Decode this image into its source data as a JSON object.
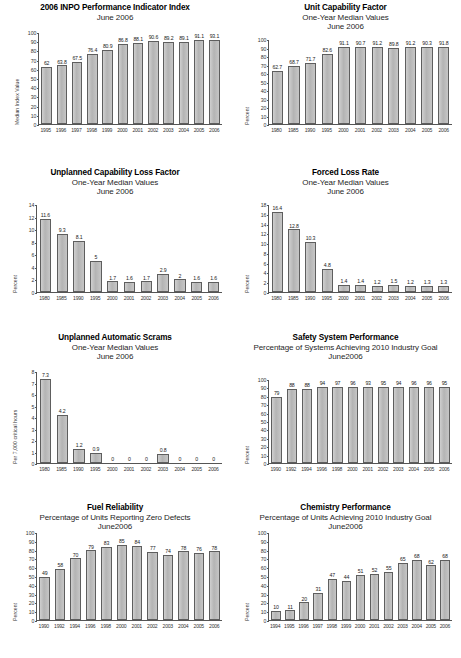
{
  "chart_data": [
    {
      "type": "bar",
      "title": "2006 INPO Performance Indicator Index",
      "subtitle": "June  2006",
      "subtitle2": "",
      "ylabel": "Median Index Value",
      "xlabel": "",
      "ylim": [
        0,
        100
      ],
      "yticks": [
        0,
        10,
        20,
        30,
        40,
        50,
        60,
        70,
        80,
        90,
        100
      ],
      "categories": [
        "1995",
        "1996",
        "1997",
        "1998",
        "1999",
        "2000",
        "2001",
        "2002",
        "2003",
        "2004",
        "2005",
        "2006"
      ],
      "values": [
        62,
        63.8,
        67.5,
        76.4,
        80.9,
        86.8,
        88.1,
        90.6,
        89.2,
        89.1,
        91.1,
        93.1
      ],
      "labels": [
        "62",
        "63.8",
        "67.5",
        "76.4",
        "80.9",
        "86.8",
        "88.1",
        "90.6",
        "89.2",
        "89.1",
        "91.1",
        "93.1"
      ],
      "grid": false,
      "legend": "none"
    },
    {
      "type": "bar",
      "title": "Unit Capability Factor",
      "subtitle": "One-Year Median Values",
      "subtitle2": "June 2006",
      "ylabel": "Percent",
      "xlabel": "",
      "ylim": [
        0,
        100
      ],
      "yticks": [
        0,
        10,
        20,
        30,
        40,
        50,
        60,
        70,
        80,
        90,
        100
      ],
      "categories": [
        "1980",
        "1985",
        "1990",
        "1995",
        "2000",
        "2001",
        "2002",
        "2003",
        "2004",
        "2005",
        "2006"
      ],
      "values": [
        62.7,
        68.7,
        71.7,
        82.6,
        91.1,
        90.7,
        91.2,
        89.8,
        91.2,
        90.3,
        91.8
      ],
      "labels": [
        "62.7",
        "68.7",
        "71.7",
        "82.6",
        "91.1",
        "90.7",
        "91.2",
        "89.8",
        "91.2",
        "90.3",
        "91.8"
      ],
      "grid": false,
      "legend": "none"
    },
    {
      "type": "bar",
      "title": "Unplanned Capability Loss Factor",
      "subtitle": "One-Year Median Values",
      "subtitle2": "June 2006",
      "ylabel": "Percent",
      "xlabel": "",
      "ylim": [
        0,
        14
      ],
      "yticks": [
        0,
        2,
        4,
        6,
        8,
        10,
        12,
        14
      ],
      "categories": [
        "1980",
        "1985",
        "1990",
        "1995",
        "2000",
        "2001",
        "2002",
        "2003",
        "2004",
        "2005",
        "2006"
      ],
      "values": [
        11.6,
        9.3,
        8.1,
        5,
        1.7,
        1.6,
        1.7,
        2.9,
        2,
        1.6,
        1.6
      ],
      "labels": [
        "11.6",
        "9.3",
        "8.1",
        "5",
        "1.7",
        "1.6",
        "1.7",
        "2.9",
        "2",
        "1.6",
        "1.6"
      ],
      "grid": false,
      "legend": "none"
    },
    {
      "type": "bar",
      "title": "Forced Loss Rate",
      "subtitle": "One-Year Median Values",
      "subtitle2": "June 2006",
      "ylabel": "Percent",
      "xlabel": "",
      "ylim": [
        0,
        18
      ],
      "yticks": [
        0,
        2,
        4,
        6,
        8,
        10,
        12,
        14,
        16,
        18
      ],
      "categories": [
        "1980",
        "1985",
        "1990",
        "1995",
        "2000",
        "2001",
        "2002",
        "2003",
        "2004",
        "2005",
        "2006"
      ],
      "values": [
        16.4,
        12.8,
        10.3,
        4.8,
        1.4,
        1.4,
        1.2,
        1.5,
        1.2,
        1.3,
        1.3
      ],
      "labels": [
        "16.4",
        "12.8",
        "10.3",
        "4.8",
        "1.4",
        "1.4",
        "1.2",
        "1.5",
        "1.2",
        "1.3",
        "1.3"
      ],
      "grid": false,
      "legend": "none"
    },
    {
      "type": "bar",
      "title": "Unplanned Automatic Scrams",
      "subtitle": "One-Year Median Values",
      "subtitle2": "June 2006",
      "ylabel": "Per 7,000 critical hours",
      "xlabel": "",
      "ylim": [
        0,
        8
      ],
      "yticks": [
        0,
        1,
        2,
        3,
        4,
        5,
        6,
        7,
        8
      ],
      "categories": [
        "1980",
        "1985",
        "1990",
        "1995",
        "2000",
        "2001",
        "2002",
        "2003",
        "2004",
        "2005",
        "2006"
      ],
      "values": [
        7.3,
        4.2,
        1.2,
        0.9,
        0,
        0,
        0,
        0.8,
        0,
        0,
        0
      ],
      "labels": [
        "7.3",
        "4.2",
        "1.2",
        "0.9",
        "0",
        "0",
        "0",
        "0.8",
        "0",
        "0",
        "0"
      ],
      "grid": false,
      "legend": "none"
    },
    {
      "type": "bar",
      "title": "Safety System Performance",
      "subtitle": "Percentage of Systems Achieving 2010 Industry Goal",
      "subtitle2": "June2006",
      "ylabel": "Percent",
      "xlabel": "",
      "ylim": [
        0,
        100
      ],
      "yticks": [
        0,
        10,
        20,
        30,
        40,
        50,
        60,
        70,
        80,
        90,
        100
      ],
      "categories": [
        "1990",
        "1992",
        "1994",
        "1996",
        "1998",
        "2000",
        "2001",
        "2002",
        "2003",
        "2004",
        "2005",
        "2006"
      ],
      "values": [
        79,
        88,
        88,
        94,
        97,
        96,
        93,
        95,
        94,
        96,
        96,
        95
      ],
      "labels": [
        "79",
        "88",
        "88",
        "94",
        "97",
        "96",
        "93",
        "95",
        "94",
        "96",
        "96",
        "95"
      ],
      "grid": false,
      "legend": "none"
    },
    {
      "type": "bar",
      "title": "Fuel Reliability",
      "subtitle": "Percentage of Units Reporting Zero Defects",
      "subtitle2": "June2006",
      "ylabel": "Percent",
      "xlabel": "",
      "ylim": [
        0,
        100
      ],
      "yticks": [
        0,
        10,
        20,
        30,
        40,
        50,
        60,
        70,
        80,
        90,
        100
      ],
      "categories": [
        "1990",
        "1992",
        "1994",
        "1996",
        "1998",
        "2000",
        "2001",
        "2002",
        "2003",
        "2004",
        "2005",
        "2006"
      ],
      "values": [
        49,
        58,
        70,
        79,
        83,
        85,
        84,
        77,
        74,
        78,
        76,
        78
      ],
      "labels": [
        "49",
        "58",
        "70",
        "79",
        "83",
        "85",
        "84",
        "77",
        "74",
        "78",
        "76",
        "78"
      ],
      "grid": false,
      "legend": "none"
    },
    {
      "type": "bar",
      "title": "Chemistry Performance",
      "subtitle": "Percentage of Units Achieving 2010 Industry Goal",
      "subtitle2": "June2006",
      "ylabel": "Percent",
      "xlabel": "",
      "ylim": [
        0,
        100
      ],
      "yticks": [
        0,
        10,
        20,
        30,
        40,
        50,
        60,
        70,
        80,
        90,
        100
      ],
      "categories": [
        "1994",
        "1995",
        "1996",
        "1997",
        "1998",
        "1999",
        "2000",
        "2001",
        "2002",
        "2003",
        "2004",
        "2005",
        "2006"
      ],
      "values": [
        10,
        11,
        20,
        31,
        47,
        44,
        51,
        52,
        55,
        65,
        68,
        62,
        68
      ],
      "labels": [
        "10",
        "11",
        "20",
        "31",
        "47",
        "44",
        "51",
        "52",
        "55",
        "65",
        "68",
        "62",
        "68"
      ],
      "grid": false,
      "legend": "none"
    }
  ],
  "colors": {
    "bar_fill": "#b9b9b9",
    "bar_stroke": "#5e5e5e",
    "axis": "#555555",
    "text": "#1a1a1a"
  }
}
